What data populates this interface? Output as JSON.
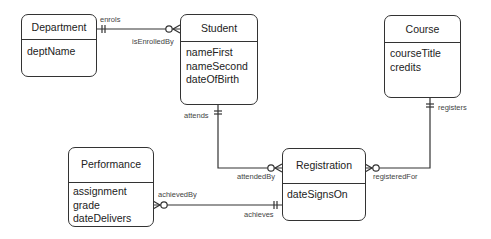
{
  "entities": {
    "department": {
      "name": "Department",
      "attributes": [
        "deptName"
      ]
    },
    "student": {
      "name": "Student",
      "attributes": [
        "nameFirst",
        "nameSecond",
        "dateOfBirth"
      ]
    },
    "course": {
      "name": "Course",
      "attributes": [
        "courseTitle",
        "credits"
      ]
    },
    "performance": {
      "name": "Performance",
      "attributes": [
        "assignment",
        "grade",
        "dateDelivers"
      ]
    },
    "registration": {
      "name": "Registration",
      "attributes": [
        "dateSignsOn"
      ]
    }
  },
  "relationships": {
    "enrols": {
      "label_a": "enrols",
      "label_b": "isEnrolledBy",
      "from": "Department",
      "to": "Student",
      "from_cardinality": "one-and-only-one",
      "to_cardinality": "zero-or-many"
    },
    "attends": {
      "label_a": "attends",
      "label_b": "attendedBy",
      "from": "Student",
      "to": "Registration",
      "from_cardinality": "one-and-only-one",
      "to_cardinality": "zero-or-many"
    },
    "registers": {
      "label_a": "registers",
      "label_b": "registeredFor",
      "from": "Course",
      "to": "Registration",
      "from_cardinality": "one-and-only-one",
      "to_cardinality": "zero-or-many"
    },
    "achieves": {
      "label_a": "achieves",
      "label_b": "achievedBy",
      "from": "Registration",
      "to": "Performance",
      "from_cardinality": "one-and-only-one",
      "to_cardinality": "zero-or-many"
    }
  }
}
